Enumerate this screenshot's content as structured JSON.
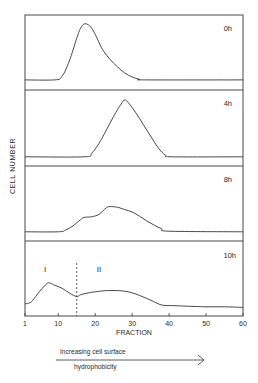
{
  "chart_data": {
    "type": "line",
    "title": "",
    "xlabel": "FRACTION",
    "ylabel": "CELL NUMBER",
    "xlim": [
      1,
      60
    ],
    "x_ticks": [
      1,
      10,
      20,
      30,
      40,
      50,
      60
    ],
    "x_tick_labels": [
      "1",
      "10",
      "20",
      "30",
      "40",
      "50",
      "60"
    ],
    "grid": false,
    "legend": "none",
    "panels": [
      {
        "label": "0h",
        "x": [
          1,
          9,
          11,
          13,
          15,
          16,
          17,
          18,
          19,
          20,
          21,
          22,
          24,
          26,
          28,
          30,
          32,
          34,
          60
        ],
        "y": [
          0.02,
          0.02,
          0.08,
          0.35,
          0.75,
          0.92,
          1.0,
          0.99,
          0.93,
          0.82,
          0.68,
          0.55,
          0.38,
          0.25,
          0.14,
          0.07,
          0.03,
          0.02,
          0.02
        ]
      },
      {
        "label": "4h",
        "x": [
          1,
          17,
          19,
          21,
          23,
          25,
          27,
          28,
          29,
          31,
          33,
          35,
          37,
          39,
          41,
          60
        ],
        "y": [
          0.02,
          0.02,
          0.08,
          0.25,
          0.48,
          0.72,
          0.93,
          1.0,
          0.95,
          0.78,
          0.58,
          0.38,
          0.18,
          0.05,
          0.02,
          0.02
        ]
      },
      {
        "label": "8h",
        "x": [
          1,
          10,
          12,
          14,
          16,
          17,
          19,
          21,
          23,
          24,
          26,
          28,
          30,
          32,
          34,
          36,
          38,
          40,
          60
        ],
        "y": [
          0.02,
          0.02,
          0.05,
          0.12,
          0.22,
          0.26,
          0.27,
          0.31,
          0.42,
          0.44,
          0.43,
          0.39,
          0.35,
          0.28,
          0.2,
          0.13,
          0.07,
          0.03,
          0.02
        ]
      },
      {
        "label": "10h",
        "annotations": [
          "I",
          "II"
        ],
        "divider_fraction": 15,
        "x": [
          1,
          2,
          3,
          5,
          7,
          8,
          9,
          11,
          13,
          15,
          16,
          18,
          20,
          23,
          26,
          29,
          32,
          35,
          38,
          41,
          45,
          50,
          55,
          60
        ],
        "y": [
          0.12,
          0.13,
          0.17,
          0.33,
          0.46,
          0.46,
          0.43,
          0.38,
          0.3,
          0.24,
          0.27,
          0.3,
          0.32,
          0.34,
          0.34,
          0.32,
          0.26,
          0.18,
          0.1,
          0.09,
          0.08,
          0.07,
          0.07,
          0.06
        ]
      }
    ]
  },
  "axis": {
    "xlabel": "FRACTION",
    "ylabel": "CELL NUMBER",
    "tick_labels": [
      "1",
      "10",
      "20",
      "30",
      "40",
      "50",
      "60"
    ]
  },
  "panels": {
    "p0": {
      "label": "0h"
    },
    "p1": {
      "label": "4h"
    },
    "p2": {
      "label": "8h"
    },
    "p3": {
      "label": "10h",
      "region_1": "I",
      "region_2": "II"
    }
  },
  "footer": {
    "arrow_line1": "Increasing cell surface",
    "arrow_line2": "hydrophobicity"
  }
}
